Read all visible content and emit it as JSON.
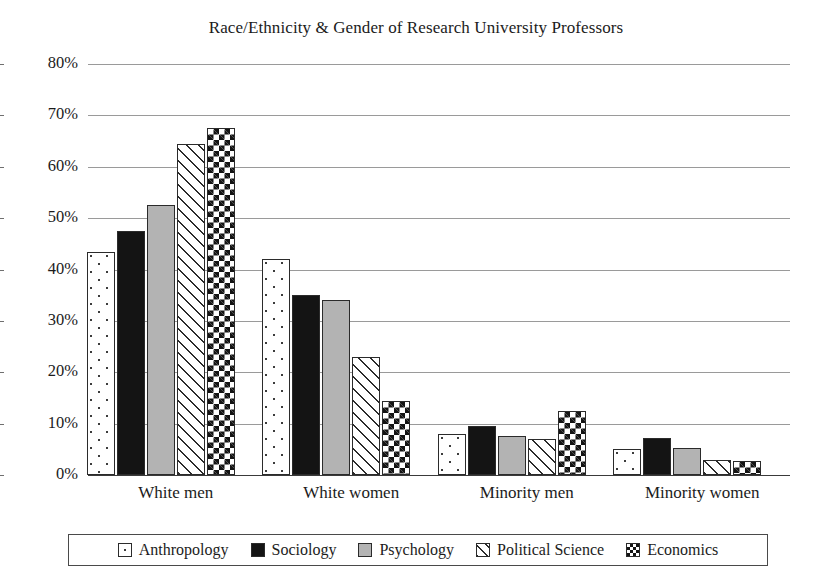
{
  "chart_data": {
    "type": "bar",
    "title": "Race/Ethnicity & Gender of Research University Professors",
    "xlabel": "",
    "ylabel": "",
    "ylim": [
      0,
      80
    ],
    "ytick_step": 10,
    "ytick_labels": [
      "0%",
      "10%",
      "20%",
      "30%",
      "40%",
      "50%",
      "60%",
      "70%",
      "80%"
    ],
    "grid": true,
    "legend_position": "bottom",
    "value_suffix": "%",
    "categories": [
      "White men",
      "White women",
      "Minority men",
      "Minority women"
    ],
    "series": [
      {
        "name": "Anthropology",
        "pattern": "dots",
        "values": [
          43.5,
          42.0,
          8.0,
          5.0
        ]
      },
      {
        "name": "Sociology",
        "pattern": "solid-black",
        "values": [
          47.5,
          35.0,
          9.5,
          7.3
        ]
      },
      {
        "name": "Psychology",
        "pattern": "solid-gray",
        "values": [
          52.5,
          34.0,
          7.5,
          5.2
        ]
      },
      {
        "name": "Political Science",
        "pattern": "diagonal",
        "values": [
          64.5,
          23.0,
          7.0,
          3.0
        ]
      },
      {
        "name": "Economics",
        "pattern": "checker",
        "values": [
          67.5,
          14.5,
          12.5,
          2.7
        ]
      }
    ]
  },
  "colors": {
    "gridline": "#9a9a9a",
    "baseline": "#3a3a3a",
    "bar_outline": "#2b2b2b",
    "black_fill": "#141414",
    "gray_fill": "#b3b3b3",
    "text": "#1b1b1b",
    "background": "#ffffff"
  }
}
